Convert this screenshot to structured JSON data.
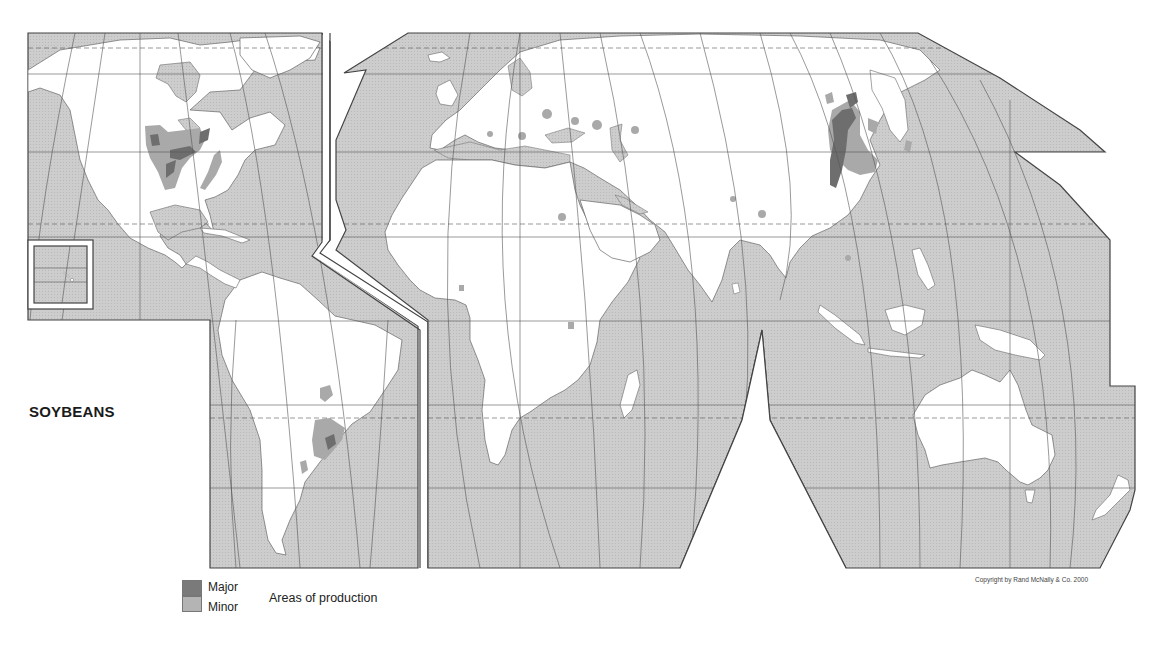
{
  "map": {
    "title": "SOYBEANS",
    "projection": "interrupted world map",
    "colors": {
      "ocean": "#c9c9c9",
      "land": "#ffffff",
      "border": "#555555",
      "graticule": "#555555",
      "major": "#6e6e6e",
      "minor": "#a9a9a9"
    },
    "production_areas": {
      "major": [
        "United States Midwest",
        "Northeast China",
        "Southern Brazil"
      ],
      "minor": [
        "United States Mississippi valley",
        "US Atlantic coast",
        "Brazil / Paraguay",
        "Argentina",
        "Eastern Europe",
        "Caspian region",
        "India",
        "Southern China",
        "Korea",
        "Japan",
        "Indonesia",
        "Egypt",
        "Nigeria",
        "Uganda"
      ]
    }
  },
  "legend": {
    "major_label": "Major",
    "minor_label": "Minor",
    "caption": "Areas of production"
  },
  "copyright": "Copyright by Rand McNally & Co. 2000"
}
